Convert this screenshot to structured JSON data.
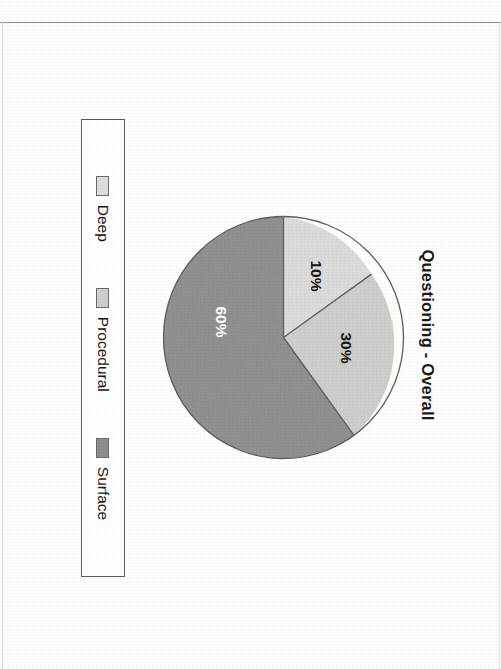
{
  "chart_data": {
    "type": "pie",
    "title": "Questioning - Overall",
    "categories": [
      "Deep",
      "Procedural",
      "Surface"
    ],
    "values": [
      10,
      30,
      60
    ],
    "value_labels": [
      "10%",
      "30%",
      "60%"
    ],
    "unit": "%",
    "colors": [
      "#dededc",
      "#cfcfcd",
      "#8d8d8d"
    ],
    "legend_position": "bottom",
    "grid": false,
    "start_angle_deg": 180,
    "direction": "clockwise",
    "xlabel": "",
    "ylabel": ""
  },
  "figure": {
    "title": "Questioning - Overall",
    "rotation_deg": 90,
    "slices": [
      {
        "label": "Deep",
        "percent_label": "10%",
        "value": 10,
        "color": "#dedddb",
        "label_color": "#141414"
      },
      {
        "label": "Procedural",
        "percent_label": "30%",
        "value": 30,
        "color": "#cfcfcc",
        "label_color": "#141414"
      },
      {
        "label": "Surface",
        "percent_label": "60%",
        "value": 60,
        "color": "#8d8d8d",
        "label_color": "#ffffff"
      }
    ],
    "legend": {
      "items": [
        {
          "label": "Deep",
          "swatch_color": "#dedddb"
        },
        {
          "label": "Procedural",
          "swatch_color": "#cfcfcc"
        },
        {
          "label": "Surface",
          "swatch_color": "#8d8d8d"
        }
      ]
    }
  }
}
